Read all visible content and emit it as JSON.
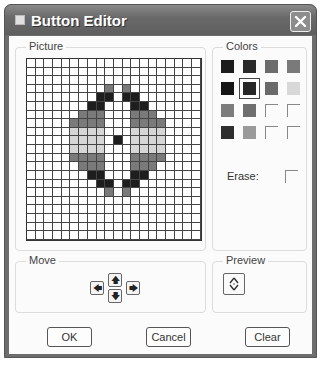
{
  "window": {
    "title": "Button Editor",
    "close_icon": "close-icon"
  },
  "picture": {
    "label": "Picture",
    "columns": 20,
    "rows": 21,
    "cells": [
      {
        "r": 3,
        "c": 9,
        "v": "G"
      },
      {
        "r": 3,
        "c": 11,
        "v": "G"
      },
      {
        "r": 4,
        "c": 8,
        "v": "D"
      },
      {
        "r": 4,
        "c": 9,
        "v": "D"
      },
      {
        "r": 4,
        "c": 11,
        "v": "D"
      },
      {
        "r": 4,
        "c": 12,
        "v": "D"
      },
      {
        "r": 5,
        "c": 7,
        "v": "D"
      },
      {
        "r": 5,
        "c": 8,
        "v": "D"
      },
      {
        "r": 5,
        "c": 12,
        "v": "D"
      },
      {
        "r": 5,
        "c": 13,
        "v": "D"
      },
      {
        "r": 6,
        "c": 6,
        "v": "G"
      },
      {
        "r": 6,
        "c": 7,
        "v": "G"
      },
      {
        "r": 6,
        "c": 8,
        "v": "G"
      },
      {
        "r": 6,
        "c": 12,
        "v": "G"
      },
      {
        "r": 6,
        "c": 13,
        "v": "G"
      },
      {
        "r": 6,
        "c": 14,
        "v": "G"
      },
      {
        "r": 7,
        "c": 5,
        "v": "G"
      },
      {
        "r": 7,
        "c": 6,
        "v": "G"
      },
      {
        "r": 7,
        "c": 7,
        "v": "G"
      },
      {
        "r": 7,
        "c": 8,
        "v": "G"
      },
      {
        "r": 7,
        "c": 12,
        "v": "G"
      },
      {
        "r": 7,
        "c": 13,
        "v": "G"
      },
      {
        "r": 7,
        "c": 14,
        "v": "G"
      },
      {
        "r": 7,
        "c": 15,
        "v": "G"
      },
      {
        "r": 8,
        "c": 5,
        "v": "L"
      },
      {
        "r": 8,
        "c": 6,
        "v": "L"
      },
      {
        "r": 8,
        "c": 7,
        "v": "L"
      },
      {
        "r": 8,
        "c": 8,
        "v": "L"
      },
      {
        "r": 8,
        "c": 12,
        "v": "L"
      },
      {
        "r": 8,
        "c": 13,
        "v": "L"
      },
      {
        "r": 8,
        "c": 14,
        "v": "L"
      },
      {
        "r": 8,
        "c": 15,
        "v": "L"
      },
      {
        "r": 9,
        "c": 5,
        "v": "L"
      },
      {
        "r": 9,
        "c": 6,
        "v": "L"
      },
      {
        "r": 9,
        "c": 7,
        "v": "L"
      },
      {
        "r": 9,
        "c": 8,
        "v": "L"
      },
      {
        "r": 9,
        "c": 10,
        "v": "D"
      },
      {
        "r": 9,
        "c": 12,
        "v": "L"
      },
      {
        "r": 9,
        "c": 13,
        "v": "L"
      },
      {
        "r": 9,
        "c": 14,
        "v": "L"
      },
      {
        "r": 9,
        "c": 15,
        "v": "L"
      },
      {
        "r": 10,
        "c": 5,
        "v": "L"
      },
      {
        "r": 10,
        "c": 6,
        "v": "L"
      },
      {
        "r": 10,
        "c": 7,
        "v": "L"
      },
      {
        "r": 10,
        "c": 8,
        "v": "L"
      },
      {
        "r": 10,
        "c": 12,
        "v": "L"
      },
      {
        "r": 10,
        "c": 13,
        "v": "L"
      },
      {
        "r": 10,
        "c": 14,
        "v": "L"
      },
      {
        "r": 10,
        "c": 15,
        "v": "L"
      },
      {
        "r": 11,
        "c": 5,
        "v": "G"
      },
      {
        "r": 11,
        "c": 6,
        "v": "G"
      },
      {
        "r": 11,
        "c": 7,
        "v": "G"
      },
      {
        "r": 11,
        "c": 8,
        "v": "G"
      },
      {
        "r": 11,
        "c": 12,
        "v": "G"
      },
      {
        "r": 11,
        "c": 13,
        "v": "G"
      },
      {
        "r": 11,
        "c": 14,
        "v": "G"
      },
      {
        "r": 11,
        "c": 15,
        "v": "G"
      },
      {
        "r": 12,
        "c": 6,
        "v": "G"
      },
      {
        "r": 12,
        "c": 7,
        "v": "G"
      },
      {
        "r": 12,
        "c": 8,
        "v": "G"
      },
      {
        "r": 12,
        "c": 12,
        "v": "G"
      },
      {
        "r": 12,
        "c": 13,
        "v": "G"
      },
      {
        "r": 12,
        "c": 14,
        "v": "G"
      },
      {
        "r": 13,
        "c": 7,
        "v": "D"
      },
      {
        "r": 13,
        "c": 8,
        "v": "D"
      },
      {
        "r": 13,
        "c": 12,
        "v": "D"
      },
      {
        "r": 13,
        "c": 13,
        "v": "D"
      },
      {
        "r": 14,
        "c": 8,
        "v": "D"
      },
      {
        "r": 14,
        "c": 9,
        "v": "D"
      },
      {
        "r": 14,
        "c": 11,
        "v": "D"
      },
      {
        "r": 14,
        "c": 12,
        "v": "D"
      },
      {
        "r": 15,
        "c": 9,
        "v": "G"
      },
      {
        "r": 15,
        "c": 11,
        "v": "G"
      }
    ]
  },
  "colors": {
    "label": "Colors",
    "swatches": [
      {
        "color": "#1c1c1c",
        "selected": false
      },
      {
        "color": "#2a2a2a",
        "selected": false
      },
      {
        "color": "#6c6c6c",
        "selected": false
      },
      {
        "color": "#7a7a7a",
        "selected": false
      },
      {
        "color": "#151515",
        "selected": false
      },
      {
        "color": "#262626",
        "selected": true
      },
      {
        "color": "#6a6a6a",
        "selected": false
      },
      {
        "color": "#d8d8d8",
        "selected": false
      },
      {
        "color": "#7c7c7c",
        "selected": false
      },
      {
        "color": "#6e6e6e",
        "selected": false
      },
      {
        "color": null,
        "selected": false
      },
      {
        "color": null,
        "selected": false
      },
      {
        "color": "#2e2e2e",
        "selected": false
      },
      {
        "color": "#9a9a9a",
        "selected": false
      },
      {
        "color": null,
        "selected": false
      },
      {
        "color": null,
        "selected": false
      }
    ],
    "erase_label": "Erase:",
    "erase_checked": false
  },
  "move": {
    "label": "Move",
    "up_glyph": "🡅",
    "down_glyph": "🡇",
    "left_glyph": "🡄",
    "right_glyph": "🡆"
  },
  "preview": {
    "label": "Preview"
  },
  "buttons": {
    "ok": "OK",
    "cancel": "Cancel",
    "clear": "Clear"
  }
}
